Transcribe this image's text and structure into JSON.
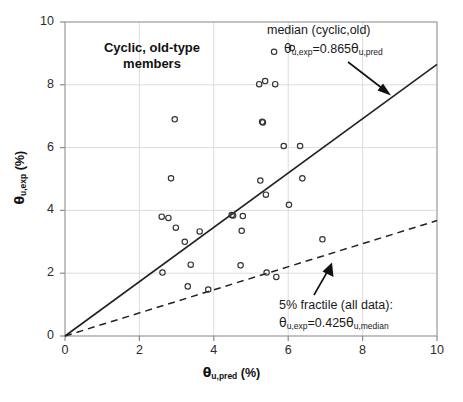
{
  "chart_data": {
    "type": "scatter",
    "title": "Cyclic, old-type members",
    "xlabel": "θu,pred (%)",
    "ylabel": "θu,exp (%)",
    "xlim": [
      0,
      10
    ],
    "ylim": [
      0,
      10
    ],
    "xticks": [
      0,
      2,
      4,
      6,
      8,
      10
    ],
    "yticks": [
      0,
      2,
      4,
      6,
      8,
      10
    ],
    "grid": true,
    "marker": "open-circle",
    "series": [
      {
        "name": "test data (cyclic, old-type members)",
        "points": [
          [
            2.6,
            3.8
          ],
          [
            2.62,
            2.02
          ],
          [
            2.78,
            3.76
          ],
          [
            2.85,
            5.02
          ],
          [
            2.95,
            6.9
          ],
          [
            2.98,
            3.45
          ],
          [
            3.22,
            3.0
          ],
          [
            3.3,
            1.58
          ],
          [
            3.62,
            3.33
          ],
          [
            3.38,
            2.27
          ],
          [
            3.85,
            1.48
          ],
          [
            4.48,
            3.85
          ],
          [
            4.52,
            3.84
          ],
          [
            4.78,
            3.82
          ],
          [
            4.75,
            3.35
          ],
          [
            4.72,
            2.25
          ],
          [
            5.22,
            8.02
          ],
          [
            5.25,
            4.95
          ],
          [
            5.3,
            6.82
          ],
          [
            5.32,
            6.8
          ],
          [
            5.38,
            8.12
          ],
          [
            5.4,
            4.5
          ],
          [
            5.42,
            2.02
          ],
          [
            5.62,
            9.05
          ],
          [
            5.65,
            8.02
          ],
          [
            5.68,
            1.88
          ],
          [
            5.88,
            6.05
          ],
          [
            6.02,
            4.18
          ],
          [
            6.32,
            6.05
          ],
          [
            6.38,
            5.02
          ],
          [
            6.92,
            3.08
          ]
        ]
      }
    ],
    "lines": [
      {
        "name": "median (cyclic, old)",
        "style": "solid",
        "slope": 0.865,
        "intercept": 0,
        "label": "median (cyclic,old)",
        "equation_prefix": "θ",
        "equation": "θu,exp=0.865θu,pred"
      },
      {
        "name": "5% fractile (all data)",
        "style": "dashed",
        "slope": 0.3676,
        "intercept": 0,
        "label": "5% fractile (all data):",
        "equation": "θu,exp=0.425θu,median"
      }
    ],
    "annotations": [
      {
        "text": "median (cyclic,old)",
        "target": "solid median line",
        "arrow": true
      },
      {
        "text": "5% fractile (all data):",
        "target": "dashed fractile line",
        "arrow": true
      }
    ]
  },
  "labels": {
    "title_line1": "Cyclic, old-type",
    "title_line2": "members",
    "median_caption": "median (cyclic,old)",
    "fractile_caption": "5% fractile (all data):",
    "xtick_0": "0",
    "xtick_1": "2",
    "xtick_2": "4",
    "xtick_3": "6",
    "xtick_4": "8",
    "xtick_5": "10",
    "ytick_0": "0",
    "ytick_1": "2",
    "ytick_2": "4",
    "ytick_3": "6",
    "ytick_4": "8",
    "ytick_5": "10"
  },
  "equations": {
    "median": {
      "lhs_theta": "θ",
      "lhs_sub": "u,exp",
      "eq": "=0.865",
      "rhs_theta": "θ",
      "rhs_sub": "u,pred"
    },
    "fractile": {
      "lhs_theta": "θ",
      "lhs_sub": "u,exp",
      "eq": "=0.425",
      "rhs_theta": "θ",
      "rhs_sub": "u,median"
    }
  },
  "axis_titles": {
    "x_theta": "θ",
    "x_sub": "u,pred",
    "x_unit": " (%)",
    "y_theta": "θ",
    "y_sub": "u,exp",
    "y_unit": " (%)"
  },
  "colors": {
    "background": "#ffffff",
    "axis": "#808080",
    "grid": "#d9d9d9",
    "line": "#222222",
    "marker": "#333333",
    "text": "#1a1a1a"
  }
}
